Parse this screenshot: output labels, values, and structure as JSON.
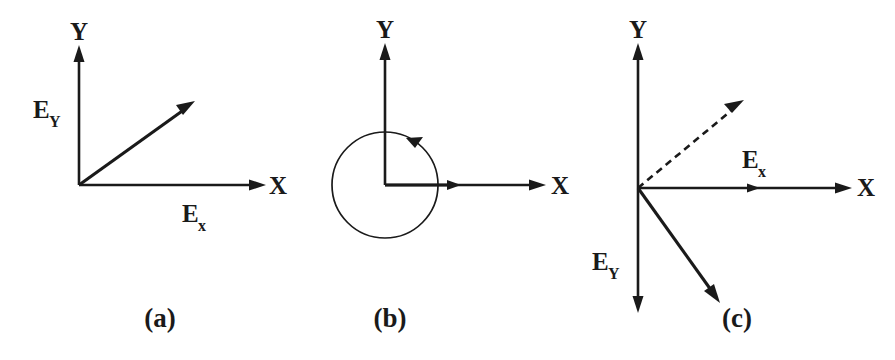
{
  "figure": {
    "background_color": "#ffffff",
    "ink_color": "#1a1a1a",
    "width": 895,
    "height": 360
  },
  "panels": [
    {
      "id": "a",
      "caption": "(a)",
      "caption_pos": {
        "x": 160,
        "y": 327
      },
      "origin": {
        "x": 79,
        "y": 185
      },
      "axes": {
        "y_label": "Y",
        "y_label_pos": {
          "x": 79,
          "y": 40
        },
        "y_tip": {
          "x": 79,
          "y": 47
        },
        "x_label": "X",
        "x_label_pos": {
          "x": 278,
          "y": 194
        },
        "x_tip": {
          "x": 265,
          "y": 185
        }
      },
      "labels": [
        {
          "name": "Ey-label",
          "base": "E",
          "sub": "Y",
          "sub_case": "upper",
          "x": 33,
          "y": 118
        },
        {
          "name": "Ex-label",
          "base": "E",
          "sub": "x",
          "sub_case": "lower",
          "x": 182,
          "y": 222
        }
      ],
      "vectors": [
        {
          "name": "resultant-vector",
          "style": "solid",
          "from": {
            "x": 79,
            "y": 185
          },
          "to": {
            "x": 193,
            "y": 103
          },
          "angle_deg": 36
        }
      ],
      "circle": null
    },
    {
      "id": "b",
      "caption": "(b)",
      "caption_pos": {
        "x": 390,
        "y": 327
      },
      "origin": {
        "x": 385,
        "y": 185
      },
      "axes": {
        "y_label": "Y",
        "y_label_pos": {
          "x": 385,
          "y": 38
        },
        "y_tip": {
          "x": 385,
          "y": 45
        },
        "x_label": "X",
        "x_label_pos": {
          "x": 560,
          "y": 194
        },
        "x_tip": {
          "x": 545,
          "y": 185
        }
      },
      "labels": [],
      "vectors": [
        {
          "name": "field-vector",
          "style": "solid",
          "from": {
            "x": 385,
            "y": 185
          },
          "to": {
            "x": 460,
            "y": 185
          },
          "angle_deg": 0
        }
      ],
      "circle": {
        "name": "rotation-circle",
        "center": {
          "x": 385,
          "y": 185
        },
        "radius": 53,
        "direction": "counterclockwise",
        "arrow_at": {
          "x": 414,
          "y": 141
        }
      }
    },
    {
      "id": "c",
      "caption": "(c)",
      "caption_pos": {
        "x": 737,
        "y": 327
      },
      "origin": {
        "x": 638,
        "y": 188
      },
      "axes": {
        "y_label": "Y",
        "y_label_pos": {
          "x": 638,
          "y": 38
        },
        "y_tip": {
          "x": 638,
          "y": 45
        },
        "y_tip_down": {
          "x": 638,
          "y": 312
        },
        "x_label": "X",
        "x_label_pos": {
          "x": 866,
          "y": 196
        },
        "x_tip": {
          "x": 851,
          "y": 188
        }
      },
      "labels": [
        {
          "name": "Ex-label",
          "base": "E",
          "sub": "x",
          "sub_case": "lower",
          "x": 742,
          "y": 168
        },
        {
          "name": "Ey-label",
          "base": "E",
          "sub": "Y",
          "sub_case": "upper",
          "x": 592,
          "y": 270
        }
      ],
      "vectors": [
        {
          "name": "dashed-resultant-vector",
          "style": "dashed",
          "from": {
            "x": 638,
            "y": 188
          },
          "to": {
            "x": 741,
            "y": 102
          },
          "angle_deg": 40
        },
        {
          "name": "solid-resultant-vector",
          "style": "solid",
          "from": {
            "x": 638,
            "y": 188
          },
          "to": {
            "x": 719,
            "y": 301
          },
          "angle_deg": -54
        },
        {
          "name": "ex-component-arrow",
          "style": "solid",
          "from": {
            "x": 638,
            "y": 188
          },
          "to": {
            "x": 757,
            "y": 188
          },
          "angle_deg": 0
        }
      ],
      "circle": null
    }
  ]
}
